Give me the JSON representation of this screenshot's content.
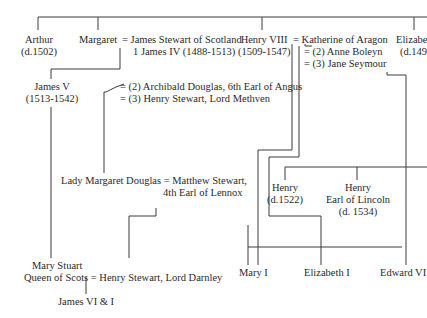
{
  "diagram": {
    "type": "family-tree",
    "people": {
      "arthur": {
        "name": "Arthur",
        "dates": "(d.1502)"
      },
      "margaret": {
        "name": "Margaret"
      },
      "james_iv": {
        "name": "= James Stewart of Scotland",
        "title": "1 James IV (1488-1513)"
      },
      "henry_viii": {
        "name": "Henry VIII",
        "dates": "(1509-1547)"
      },
      "katherine": {
        "name": "=  Katherine of Aragon"
      },
      "anne": {
        "name": "=  (2) Anne Boleyn"
      },
      "jane": {
        "name": "=  (3) Jane Seymour"
      },
      "elizabeth": {
        "name": "Elizabe",
        "dates": "(d.149"
      },
      "james_v": {
        "name": "James V",
        "dates": "(1513-1542)"
      },
      "archibald": {
        "name": "= (2) Archibald Douglas, 6th Earl of Angus"
      },
      "henry_methven": {
        "name": "= (3) Henry Stewart, Lord Methven"
      },
      "margaret_douglas": {
        "name": "Lady Margaret Douglas = Matthew Stewart,",
        "title": "4th Earl of Lennox"
      },
      "henry_1522": {
        "name": "Henry",
        "dates": "(d.1522)"
      },
      "henry_lincoln": {
        "name": "Henry",
        "title": "Earl of Lincoln",
        "dates": "(d. 1534)"
      },
      "mary_stuart": {
        "name": "Mary Stuart",
        "title": "Queen of Scots = Henry Stewart, Lord Darnley"
      },
      "james_vi": {
        "name": "James VI & I"
      },
      "mary_i": {
        "name": "Mary I"
      },
      "elizabeth_i": {
        "name": "Elizabeth I"
      },
      "edward_vi": {
        "name": "Edward VI"
      }
    }
  }
}
